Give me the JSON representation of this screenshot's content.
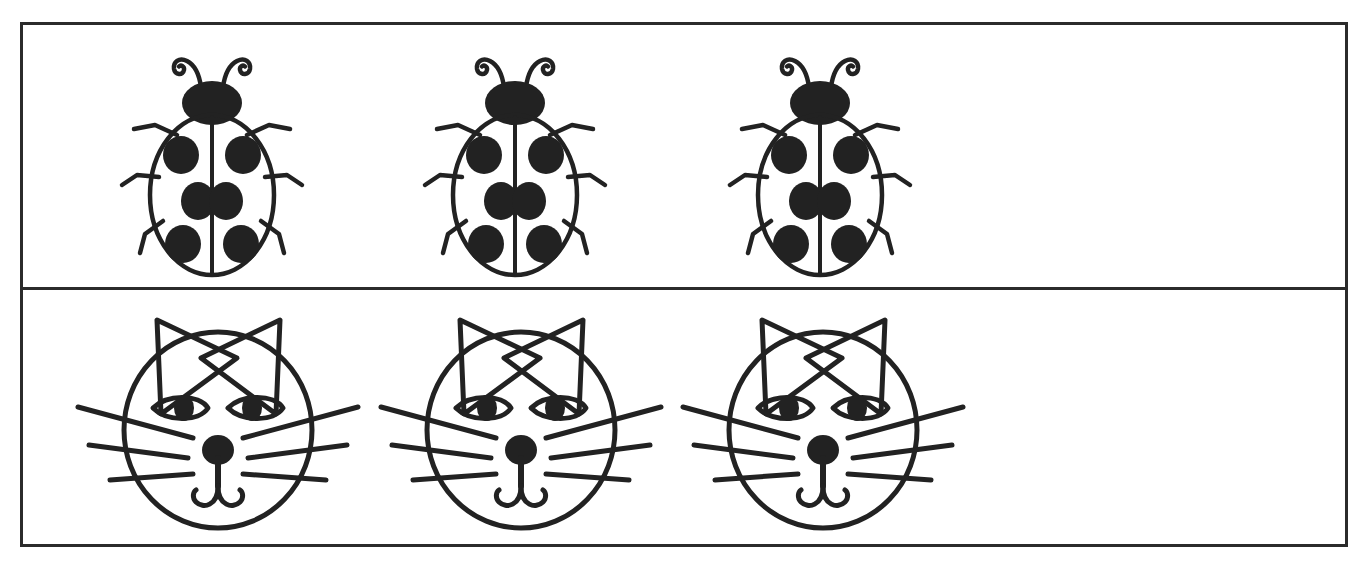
{
  "page": {
    "background_color": "#ffffff",
    "ink_color": "#222222",
    "width": 1363,
    "height": 562
  },
  "frame": {
    "name": "outer-border",
    "border_color": "#2b2b2b",
    "border_width": 3,
    "left": 20,
    "top": 22,
    "width": 1328,
    "height": 525
  },
  "divider": {
    "name": "row-divider",
    "top": 287,
    "color": "#2b2b2b",
    "thickness": 3
  },
  "rows": [
    {
      "id": "row-ladybugs",
      "label": "Ladybug row",
      "item_name": "ladybug",
      "count": 3,
      "items": [
        {
          "label": "ladybug-1",
          "x": 95,
          "y": 10,
          "spots": 6
        },
        {
          "label": "ladybug-2",
          "x": 398,
          "y": 10,
          "spots": 6
        },
        {
          "label": "ladybug-3",
          "x": 703,
          "y": 10,
          "spots": 6
        }
      ],
      "empty_space_starts_at": 1010
    },
    {
      "id": "row-cats",
      "label": "Cat face row",
      "item_name": "cat-face",
      "count": 3,
      "items": [
        {
          "label": "cat-1",
          "x": 45,
          "y": 8,
          "whiskers_per_side": 3
        },
        {
          "label": "cat-2",
          "x": 348,
          "y": 8,
          "whiskers_per_side": 3
        },
        {
          "label": "cat-3",
          "x": 650,
          "y": 8,
          "whiskers_per_side": 3
        }
      ],
      "empty_space_starts_at": 960
    }
  ],
  "ladybug": {
    "name": "ladybug-drawing",
    "parts": [
      "antennae",
      "head",
      "body",
      "wing-split-line",
      "spots",
      "legs"
    ],
    "spot_count": 6,
    "spots_per_wing": 3,
    "legs_per_side": 3,
    "head_color": "#222222",
    "body_fill": "#ffffff"
  },
  "cat": {
    "name": "cat-face-drawing",
    "parts": [
      "ears",
      "head",
      "eyes",
      "pupils",
      "nose",
      "muzzle",
      "mouth",
      "whiskers"
    ],
    "ear_count": 2,
    "eye_count": 2,
    "whiskers_per_side": 3,
    "nose_color": "#222222",
    "head_fill": "#ffffff"
  }
}
